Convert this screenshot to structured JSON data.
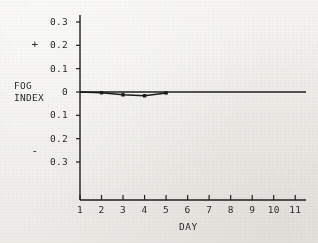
{
  "chart_data": {
    "type": "line",
    "title": "",
    "xlabel": "DAY",
    "ylabel": "FOG INDEX",
    "ylabel_lines": [
      "FOG",
      "INDEX"
    ],
    "x": [
      1,
      2,
      3,
      4,
      5,
      6,
      7,
      8,
      9,
      10,
      11
    ],
    "xtick_labels": [
      "1",
      "2",
      "3",
      "4",
      "5",
      "6",
      "7",
      "8",
      "9",
      "10",
      "11"
    ],
    "xlim": [
      1,
      11.5
    ],
    "ylim": [
      -0.35,
      0.35
    ],
    "ytick_values": [
      0.3,
      0.2,
      0.1,
      0,
      -0.1,
      -0.2,
      -0.3
    ],
    "ytick_labels": [
      "0.3",
      "0.2",
      "0.1",
      "0",
      "0.1",
      "0.2",
      "0.3"
    ],
    "positive_sign_label": "+",
    "negative_sign_label": "-",
    "positive_sign_at": 0.2,
    "negative_sign_at": -0.2,
    "grid": false,
    "legend": false,
    "zero_reference_line": true,
    "series": [
      {
        "name": "Fog index",
        "marker": "dot",
        "values": [
          0,
          -0.003,
          -0.012,
          -0.016,
          -0.004
        ],
        "x": [
          1,
          2,
          3,
          4,
          5
        ],
        "marked_points_x": [
          2,
          3,
          4,
          5
        ]
      }
    ],
    "line_color": "#1a1a1a",
    "axis_color": "#1a1a1a",
    "background_color": "#f2f1ee"
  }
}
